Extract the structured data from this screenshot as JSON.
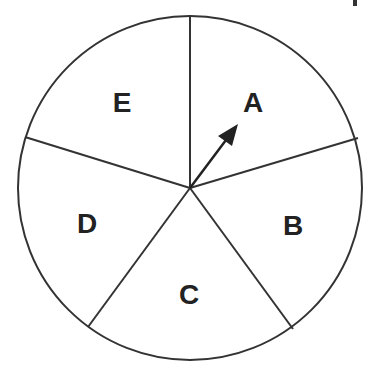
{
  "diagram": {
    "type": "spinner",
    "center": [
      190,
      188
    ],
    "radius": 172,
    "stroke_color": "#333333",
    "sections": [
      {
        "label": "A",
        "x": 253,
        "y": 112
      },
      {
        "label": "B",
        "x": 293,
        "y": 235
      },
      {
        "label": "C",
        "x": 189,
        "y": 304
      },
      {
        "label": "D",
        "x": 87,
        "y": 233
      },
      {
        "label": "E",
        "x": 122,
        "y": 112
      }
    ],
    "spokes": [
      [
        190,
        17
      ],
      [
        358,
        138
      ],
      [
        293,
        329
      ],
      [
        88,
        327
      ],
      [
        25,
        137
      ]
    ],
    "arrow": {
      "from": [
        190,
        188
      ],
      "to": [
        238,
        124
      ],
      "points_to": "A"
    }
  }
}
